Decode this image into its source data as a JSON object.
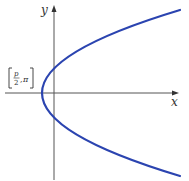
{
  "figure": {
    "axes": {
      "x_label": "x",
      "y_label": "y"
    },
    "curve": {
      "type": "parabola",
      "opens": "right",
      "color": "#2b44b0",
      "vertex_label": {
        "numerator": "p",
        "denominator": "2",
        "angle": "π"
      }
    },
    "colors": {
      "axis": "#555555",
      "text": "#333333",
      "curve": "#2b44b0"
    }
  }
}
